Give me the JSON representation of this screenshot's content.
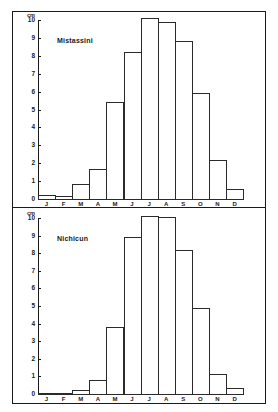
{
  "chart_data": [
    {
      "type": "bar",
      "title": "Mistassini",
      "xlabel": "",
      "ylabel": "cm",
      "ylim": [
        0,
        10
      ],
      "yticks": [
        0,
        1,
        2,
        3,
        4,
        5,
        6,
        7,
        8,
        9,
        10
      ],
      "grid": false,
      "categories": [
        "J",
        "F",
        "M",
        "A",
        "M",
        "J",
        "J",
        "A",
        "S",
        "O",
        "N",
        "D"
      ],
      "values": [
        0.25,
        0.15,
        0.85,
        1.7,
        5.4,
        8.2,
        10.1,
        9.9,
        8.8,
        5.9,
        2.2,
        0.55
      ]
    },
    {
      "type": "bar",
      "title": "Nichicun",
      "xlabel": "",
      "ylabel": "cm",
      "ylim": [
        0,
        10
      ],
      "yticks": [
        0,
        1,
        2,
        3,
        4,
        5,
        6,
        7,
        8,
        9,
        10
      ],
      "grid": false,
      "categories": [
        "J",
        "F",
        "M",
        "A",
        "M",
        "J",
        "J",
        "A",
        "S",
        "O",
        "N",
        "D"
      ],
      "values": [
        0.05,
        0.05,
        0.2,
        0.8,
        3.8,
        8.9,
        10.1,
        10.05,
        8.2,
        4.9,
        1.15,
        0.35
      ]
    }
  ],
  "panels": [
    {
      "station": "Mistassini",
      "unit": "cm"
    },
    {
      "station": "Nichicun",
      "unit": "cm"
    }
  ]
}
